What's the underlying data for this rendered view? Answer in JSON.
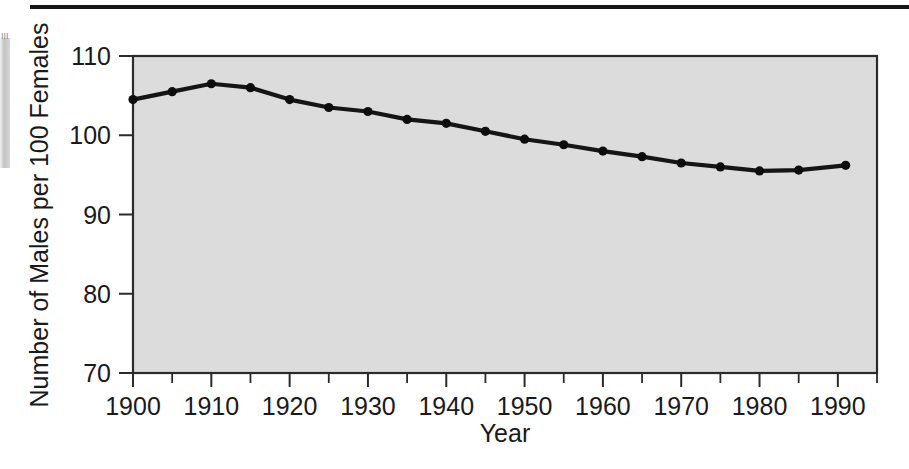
{
  "figure": {
    "top_rule": "horizontal-rule",
    "background_color": "#ffffff",
    "plot_fill_color": "#dcdcdc",
    "line_color": "#151515",
    "edge_artifact_label": "III"
  },
  "chart_data": {
    "type": "line",
    "title": "",
    "subtitle": "",
    "xlabel": "Year",
    "ylabel": "Number of Males per 100 Females",
    "xlim": [
      1900,
      1995
    ],
    "ylim": [
      70,
      110
    ],
    "grid": false,
    "legend": "none",
    "x_tick_labels": [
      "1900",
      "1910",
      "1920",
      "1930",
      "1940",
      "1950",
      "1960",
      "1970",
      "1980",
      "1990"
    ],
    "x_ticks": [
      1900,
      1910,
      1920,
      1930,
      1940,
      1950,
      1960,
      1970,
      1980,
      1990
    ],
    "x_minor_ticks": [
      1905,
      1915,
      1925,
      1935,
      1945,
      1955,
      1965,
      1975,
      1985,
      1995
    ],
    "y_tick_labels": [
      "70",
      "80",
      "90",
      "100",
      "110"
    ],
    "y_ticks": [
      70,
      80,
      90,
      100,
      110
    ],
    "x": [
      1900,
      1905,
      1910,
      1915,
      1920,
      1925,
      1930,
      1935,
      1940,
      1945,
      1950,
      1955,
      1960,
      1965,
      1970,
      1975,
      1980,
      1985,
      1991
    ],
    "values": [
      104.5,
      105.5,
      106.5,
      106.0,
      104.5,
      103.5,
      103.0,
      102.0,
      101.5,
      100.5,
      99.5,
      98.8,
      98.0,
      97.3,
      96.5,
      96.0,
      95.5,
      95.6,
      96.2
    ],
    "series": [
      {
        "name": "Males per 100 Females",
        "values": [
          104.5,
          105.5,
          106.5,
          106.0,
          104.5,
          103.5,
          103.0,
          102.0,
          101.5,
          100.5,
          99.5,
          98.8,
          98.0,
          97.3,
          96.5,
          96.0,
          95.5,
          95.6,
          96.2
        ]
      }
    ],
    "marker": "filled-circle"
  }
}
